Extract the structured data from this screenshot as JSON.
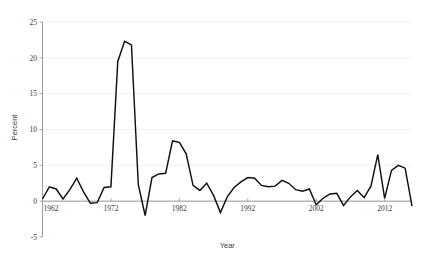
{
  "chart_data": {
    "type": "line",
    "title": "",
    "xlabel": "Year",
    "ylabel": "Percent",
    "xlim": [
      1962,
      2016
    ],
    "ylim": [
      -5,
      25
    ],
    "ytick_values": [
      -5,
      0,
      5,
      10,
      15,
      20,
      25
    ],
    "ytick_labels": [
      "-5",
      "0",
      "5",
      "10",
      "15",
      "20",
      "25"
    ],
    "xtick_values": [
      1962,
      1972,
      1982,
      1992,
      2002,
      2012
    ],
    "xtick_labels": [
      "1962",
      "1972",
      "1982",
      "1992",
      "2002",
      "2012"
    ],
    "grid": true,
    "legend": "none",
    "line_color": "#101010",
    "grid_color": "#e9e9ec",
    "axis_color": "#9a9a9a",
    "x": [
      1962,
      1963,
      1964,
      1965,
      1966,
      1967,
      1968,
      1969,
      1970,
      1971,
      1972,
      1973,
      1974,
      1975,
      1976,
      1977,
      1978,
      1979,
      1980,
      1981,
      1982,
      1983,
      1984,
      1985,
      1986,
      1987,
      1988,
      1989,
      1990,
      1991,
      1992,
      1993,
      1994,
      1995,
      1996,
      1997,
      1998,
      1999,
      2000,
      2001,
      2002,
      2003,
      2004,
      2005,
      2006,
      2007,
      2008,
      2009,
      2010,
      2011,
      2012,
      2013,
      2014,
      2015,
      2016
    ],
    "values": [
      0.3,
      2.0,
      1.7,
      0.3,
      1.6,
      3.2,
      1.3,
      -0.3,
      -0.2,
      1.9,
      2.0,
      19.5,
      22.3,
      21.8,
      2.3,
      -2.0,
      3.3,
      3.8,
      3.9,
      8.4,
      8.2,
      6.6,
      2.2,
      1.5,
      2.5,
      0.8,
      -1.6,
      0.6,
      1.9,
      2.7,
      3.3,
      3.2,
      2.2,
      2.0,
      2.1,
      2.9,
      2.5,
      1.6,
      1.4,
      1.7,
      -0.5,
      0.4,
      1.0,
      1.1,
      -0.6,
      0.6,
      1.5,
      0.5,
      2.1,
      6.5,
      0.4,
      4.3,
      5.0,
      4.6,
      -0.7
    ],
    "series_name": "Percent"
  }
}
